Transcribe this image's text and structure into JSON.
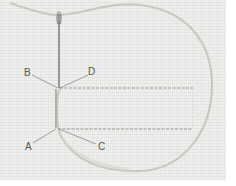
{
  "diagram": {
    "type": "embroidery stitch illustration",
    "labels": [
      {
        "id": "A",
        "text": "A"
      },
      {
        "id": "B",
        "text": "B"
      },
      {
        "id": "C",
        "text": "C"
      },
      {
        "id": "D",
        "text": "D"
      }
    ],
    "colors": {
      "fabric": "#f1f1ef",
      "thread": "#c8c8c4",
      "stitch": "#9a9a96",
      "needle": "#6a6a6a",
      "leader_line": "#8a8a8a",
      "label_text": "#555555"
    }
  }
}
